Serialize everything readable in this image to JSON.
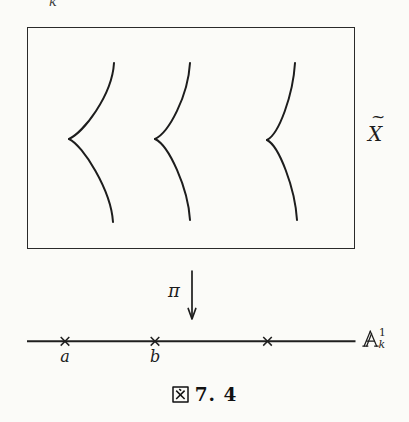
{
  "figure": {
    "corner_label": "k",
    "total_space": {
      "letter": "X",
      "accent": "~"
    },
    "map_label": "π",
    "base_line": {
      "letter": "A",
      "letter_style": "double-struck",
      "superscript": "1",
      "subscript": "k",
      "points": [
        {
          "label": "a"
        },
        {
          "label": "b"
        },
        {
          "label": ""
        }
      ]
    },
    "caption": {
      "prefix": "図",
      "number": "7. 4"
    }
  },
  "colors": {
    "ink": "#1d1d1d",
    "paper": "#fbfbf8"
  }
}
